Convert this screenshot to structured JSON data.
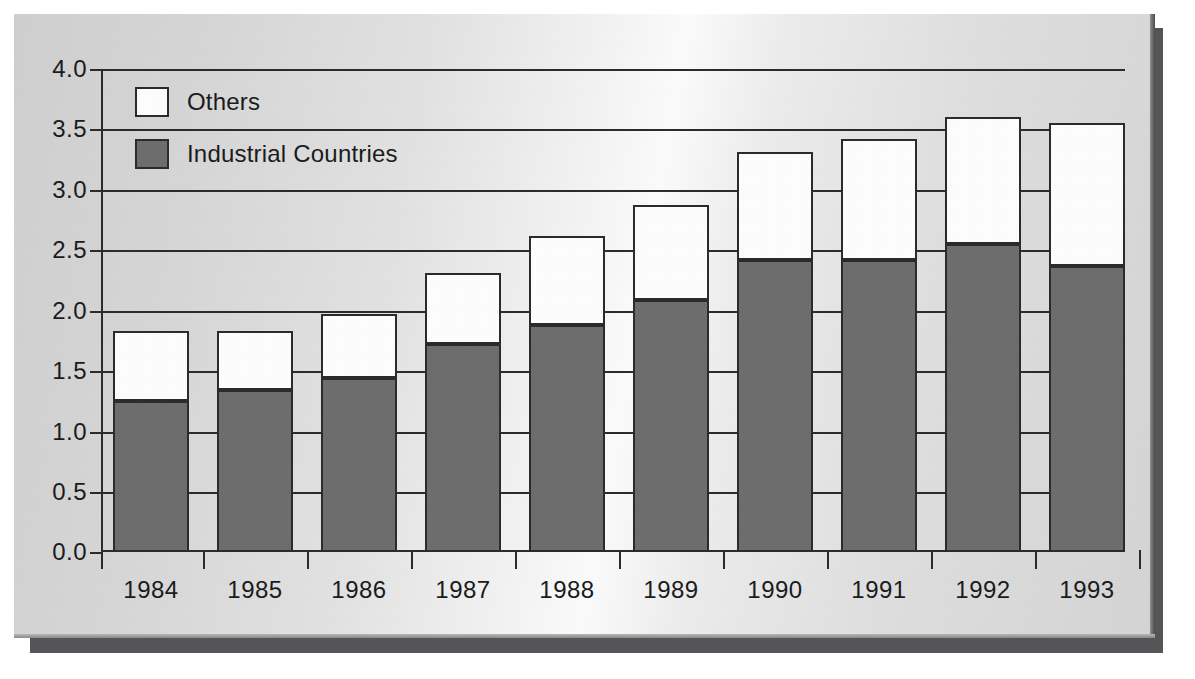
{
  "chart_data": {
    "type": "bar",
    "subtype": "stacked-bar",
    "title": "",
    "xlabel": "",
    "ylabel": "",
    "ylim": [
      0.0,
      4.0
    ],
    "ytick_step": 0.5,
    "grid": true,
    "legend_position": "top-left",
    "categories": [
      "1984",
      "1985",
      "1986",
      "1987",
      "1988",
      "1989",
      "1990",
      "1991",
      "1992",
      "1993"
    ],
    "ytick_labels": [
      "0.0",
      "0.5",
      "1.0",
      "1.5",
      "2.0",
      "2.5",
      "3.0",
      "3.5",
      "4.0"
    ],
    "ytick_values": [
      0.0,
      0.5,
      1.0,
      1.5,
      2.0,
      2.5,
      3.0,
      3.5,
      4.0
    ],
    "series": [
      {
        "name": "Industrial Countries",
        "color": "#6d6d6d",
        "values": [
          1.25,
          1.34,
          1.44,
          1.72,
          1.88,
          2.09,
          2.42,
          2.42,
          2.55,
          2.37
        ]
      },
      {
        "name": "Others",
        "color": "#ffffff",
        "values": [
          0.58,
          0.49,
          0.53,
          0.59,
          0.74,
          0.78,
          0.89,
          1.0,
          1.05,
          1.18
        ]
      }
    ],
    "totals": [
      1.83,
      1.83,
      1.97,
      2.31,
      2.62,
      2.87,
      3.31,
      3.42,
      3.6,
      3.55
    ]
  },
  "legend": {
    "items": [
      {
        "label": "Others",
        "swatch": "white"
      },
      {
        "label": "Industrial Countries",
        "swatch": "dark-gray"
      }
    ]
  },
  "colors": {
    "industrial": "#6d6d6d",
    "others": "#ffffff",
    "axis": "#2b2b2b",
    "panel_background": "#d8d8d8",
    "page_background": "#ffffff",
    "shadow": "#555456"
  }
}
